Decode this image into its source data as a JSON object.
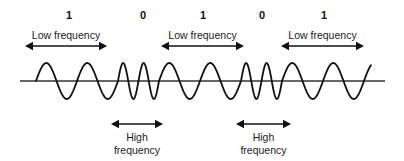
{
  "diagram": {
    "bits": [
      {
        "label": "1",
        "x": 69
      },
      {
        "label": "0",
        "x": 143
      },
      {
        "label": "1",
        "x": 203
      },
      {
        "label": "0",
        "x": 262
      },
      {
        "label": "1",
        "x": 324
      }
    ],
    "low_frequency_labels": [
      {
        "text": "Low frequency",
        "x1": 25,
        "x2": 107
      },
      {
        "text": "Low frequency",
        "x1": 161,
        "x2": 244
      },
      {
        "text": "Low frequency",
        "x1": 281,
        "x2": 364
      }
    ],
    "high_frequency_labels": [
      {
        "line1": "High",
        "line2": "frequency",
        "x1": 111,
        "x2": 163
      },
      {
        "line1": "High",
        "line2": "frequency",
        "x1": 236,
        "x2": 291
      }
    ],
    "signal": {
      "baseline_y": 81,
      "baseline_x1": 20,
      "baseline_x2": 385,
      "amplitude": 18,
      "segments": [
        {
          "bit": "1",
          "type": "low",
          "x_start": 36,
          "x_end": 118,
          "cycles": 2
        },
        {
          "bit": "0",
          "type": "high",
          "x_start": 118,
          "x_end": 159,
          "cycles": 2
        },
        {
          "bit": "1",
          "type": "low",
          "x_start": 159,
          "x_end": 241,
          "cycles": 2
        },
        {
          "bit": "0",
          "type": "high",
          "x_start": 241,
          "x_end": 282,
          "cycles": 2
        },
        {
          "bit": "1",
          "type": "low",
          "x_start": 282,
          "x_end": 364,
          "cycles": 2
        }
      ],
      "tail_end_x": 371
    },
    "colors": {
      "ink": "#111111",
      "baseline": "#333333",
      "background": "#ffffff"
    }
  }
}
